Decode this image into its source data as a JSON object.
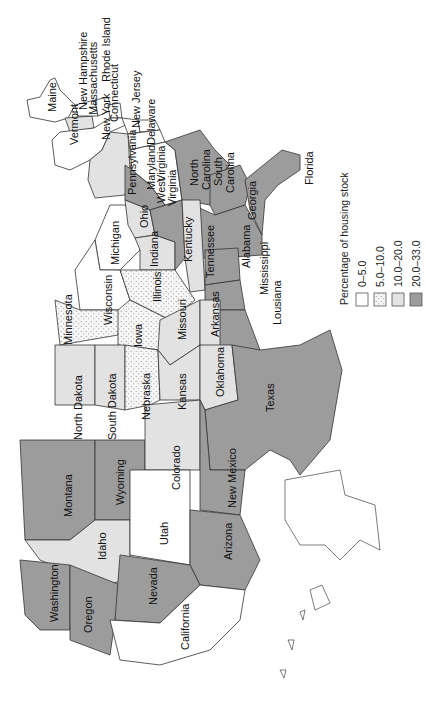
{
  "legend": {
    "title": "Percentage of housing stock",
    "items": [
      {
        "label": "0–5.0",
        "fill": "#ffffff",
        "pattern": "none"
      },
      {
        "label": "5.0–10.0",
        "fill": "#f4f4f4",
        "pattern": "dots"
      },
      {
        "label": "10.0–20.0",
        "fill": "#e2e2e2",
        "pattern": "none"
      },
      {
        "label": "20.0–33.0",
        "fill": "#9c9c9c",
        "pattern": "none"
      }
    ]
  },
  "states": {
    "Maine": "0–5.0",
    "New Hampshire": "0–5.0",
    "Vermont": "10.0–20.0",
    "Massachusetts": "0–5.0",
    "Rhode Island": "0–5.0",
    "Connecticut": "0–5.0",
    "New York": "0–5.0",
    "New Jersey": "0–5.0",
    "Pennsylvania": "10.0–20.0",
    "Delaware": "0–5.0",
    "Maryland": "0–5.0",
    "Virginia": "0–5.0",
    "West Virginia": "20.0–33.0",
    "North Carolina": "20.0–33.0",
    "South Carolina": "20.0–33.0",
    "Georgia": "20.0–33.0",
    "Florida": "20.0–33.0",
    "Ohio": "10.0–20.0",
    "Michigan": "0–5.0",
    "Indiana": "10.0–20.0",
    "Kentucky": "20.0–33.0",
    "Tennessee": "10.0–20.0",
    "Alabama": "20.0–33.0",
    "Mississippi": "20.0–33.0",
    "Louisiana": "20.0–33.0",
    "Illinois": "5.0–10.0",
    "Wisconsin": "0–5.0",
    "Minnesota": "5.0–10.0",
    "Iowa": "5.0–10.0",
    "Missouri": "10.0–20.0",
    "Arkansas": "10.0–20.0",
    "North Dakota": "10.0–20.0",
    "South Dakota": "10.0–20.0",
    "Nebraska": "5.0–10.0",
    "Kansas": "10.0–20.0",
    "Oklahoma": "10.0–20.0",
    "Texas": "20.0–33.0",
    "Montana": "20.0–33.0",
    "Wyoming": "20.0–33.0",
    "Colorado": "10.0–20.0",
    "New Mexico": "20.0–33.0",
    "Idaho": "10.0–20.0",
    "Utah": "0–5.0",
    "Arizona": "20.0–33.0",
    "Washington": "20.0–33.0",
    "Oregon": "20.0–33.0",
    "Nevada": "20.0–33.0",
    "California": "0–5.0"
  },
  "labels": {
    "maine": "Maine",
    "new_hampshire": "New Hampshire",
    "vermont": "Vermont",
    "massachusetts": "Massachusetts",
    "rhode_island": "Rhode Island",
    "connecticut": "Connecticut",
    "new_york": "New York",
    "new_jersey": "New Jersey",
    "pennsylvania": "Pennsylvania",
    "delaware": "Delaware",
    "maryland": "Maryland",
    "virginia": "Virginia",
    "west": "West",
    "virginia2": "Virginia",
    "north": "North",
    "carolina_n": "Carolina",
    "south": "South",
    "carolina_s": "Carolina",
    "georgia": "Georgia",
    "florida": "Florida",
    "ohio": "Ohio",
    "michigan": "Michigan",
    "indiana": "Indiana",
    "kentucky": "Kentucky",
    "tennessee": "Tennessee",
    "alabama": "Alabama",
    "mississippi": "Mississippi",
    "louisiana": "Lousiana",
    "illinois": "Illinois",
    "wisconsin": "Wisconsin",
    "minnesota": "Minnesota",
    "iowa": "Iowa",
    "missouri": "Missouri",
    "arkansas": "Arkansas",
    "north_dakota": "North Dakota",
    "south_dakota": "South Dakota",
    "nebraska": "Nebraska",
    "kansas": "Kansas",
    "oklahoma": "Oklahoma",
    "texas": "Texas",
    "montana": "Montana",
    "wyoming": "Wyoming",
    "colorado": "Colorado",
    "new_mexico": "New Mexico",
    "idaho": "Idaho",
    "utah": "Utah",
    "arizona": "Arizona",
    "washington": "Washington",
    "oregon": "Oregon",
    "nevada": "Nevada",
    "california": "California"
  }
}
